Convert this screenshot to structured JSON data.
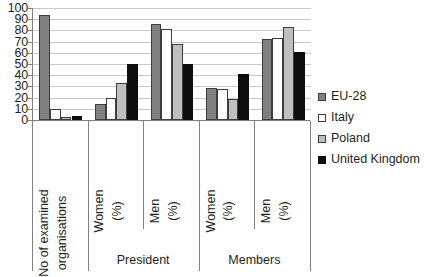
{
  "chart_data": {
    "type": "bar",
    "title": "",
    "subtitle": "",
    "xlabel": "",
    "ylabel": "",
    "ylim": [
      0,
      100
    ],
    "ytick_labels": [
      "100",
      "90",
      "80",
      "70",
      "60",
      "50",
      "40",
      "30",
      "20",
      "10",
      "0"
    ],
    "ytick_values": [
      100,
      90,
      80,
      70,
      60,
      50,
      40,
      30,
      20,
      10,
      0
    ],
    "grid": true,
    "legend_position": "right",
    "categories": [
      "No of examined organisations",
      "Women (%)",
      "Men (%)",
      "Women (%)",
      "Men (%)"
    ],
    "category_labels": [
      {
        "line1": "No of examined",
        "line2": "organisations"
      },
      {
        "line1": "Women",
        "line2": "(%)"
      },
      {
        "line1": "Men",
        "line2": "(%)"
      },
      {
        "line1": "Women",
        "line2": "(%)"
      },
      {
        "line1": "Men",
        "line2": "(%)"
      }
    ],
    "group_labels": [
      "",
      "President",
      "Members"
    ],
    "groups": [
      {
        "label": "",
        "span": 1
      },
      {
        "label": "President",
        "span": 2
      },
      {
        "label": "Members",
        "span": 2
      }
    ],
    "series": [
      {
        "name": "EU-28",
        "color": "#808080",
        "values": [
          94,
          14,
          86,
          29,
          72
        ]
      },
      {
        "name": "Italy",
        "color": "#ffffff",
        "values": [
          10,
          20,
          81,
          28,
          73
        ]
      },
      {
        "name": "Poland",
        "color": "#bfbfbf",
        "values": [
          3,
          33,
          68,
          19,
          83
        ]
      },
      {
        "name": "United Kingdom",
        "color": "#0d0d0d",
        "values": [
          4,
          50,
          50,
          41,
          61
        ]
      }
    ]
  },
  "legend": {
    "items": [
      {
        "label": "EU-28"
      },
      {
        "label": "Italy"
      },
      {
        "label": "Poland"
      },
      {
        "label": "United Kingdom"
      }
    ]
  }
}
